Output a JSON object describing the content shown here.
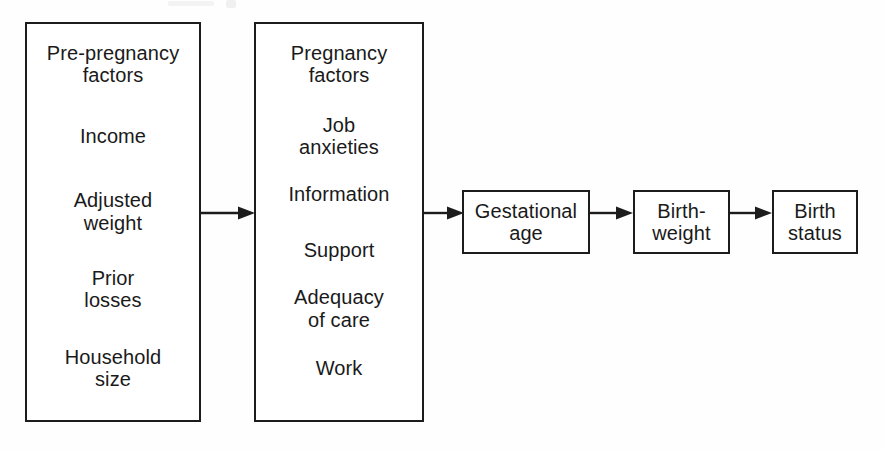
{
  "diagram": {
    "type": "flow-diagram",
    "title": "",
    "orientation": "left-to-right",
    "background_color": "#fefefe",
    "line_color": "#1c1c1c",
    "text_color": "#1a1a1a",
    "nodes": [
      {
        "id": "pre-pregnancy-factors",
        "shape": "rectangle",
        "heading": "Pre-pregnancy\nfactors",
        "entries": [
          "Pre-pregnancy\nfactors",
          "Income",
          "Adjusted\nweight",
          "Prior\nlosses",
          "Household\nsize"
        ]
      },
      {
        "id": "pregnancy-factors",
        "shape": "rectangle",
        "heading": "Pregnancy\nfactors",
        "entries": [
          "Pregnancy\nfactors",
          "Job\nanxieties",
          "Information",
          "Support",
          "Adequacy\nof care",
          "Work"
        ]
      },
      {
        "id": "gestational-age",
        "shape": "rectangle",
        "entries": [
          "Gestational\nage"
        ]
      },
      {
        "id": "birth-weight",
        "shape": "rectangle",
        "entries": [
          "Birth-\nweight"
        ]
      },
      {
        "id": "birth-status",
        "shape": "rectangle",
        "entries": [
          "Birth\nstatus"
        ]
      }
    ],
    "edges": [
      {
        "id": "edge-1",
        "from": "pre-pregnancy-factors",
        "to": "pregnancy-factors",
        "label": ""
      },
      {
        "id": "edge-2",
        "from": "pregnancy-factors",
        "to": "gestational-age",
        "label": ""
      },
      {
        "id": "edge-3",
        "from": "gestational-age",
        "to": "birth-weight",
        "label": ""
      },
      {
        "id": "edge-4",
        "from": "birth-weight",
        "to": "birth-status",
        "label": ""
      }
    ]
  }
}
